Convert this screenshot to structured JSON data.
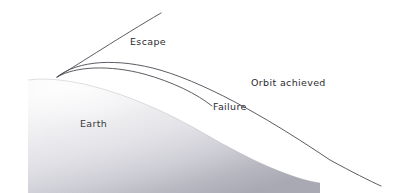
{
  "diagram": {
    "background_color": "#ffffff",
    "width": 399,
    "height": 193,
    "launch_point": {
      "x": 57,
      "y": 77
    },
    "planet": {
      "name": "Earth",
      "label": "Earth",
      "label_position": {
        "x": 80,
        "y": 127
      },
      "fill_light": "#f2f2f4",
      "fill_mid": "#d9d9de",
      "fill_dark": "#b9b9c2",
      "limb_edge_color": "#9a9aa4"
    },
    "trajectories": [
      {
        "id": "escape",
        "label": "Escape",
        "label_position": {
          "x": 130,
          "y": 45
        },
        "stroke_color": "#4a4a52",
        "description": "Near-straight line departing upward to the right, leaving the frame",
        "endpoint": {
          "x": 161,
          "y": 13
        }
      },
      {
        "id": "orbit-achieved",
        "label": "Orbit achieved",
        "label_position": {
          "x": 251,
          "y": 86
        },
        "stroke_color": "#4a4a52",
        "description": "Upper arcing curve that clears the limb and continues off the lower right edge",
        "endpoint": {
          "x": 381,
          "y": 186
        }
      },
      {
        "id": "failure",
        "label": "Failure",
        "label_position": {
          "x": 213,
          "y": 110
        },
        "stroke_color": "#4a4a52",
        "description": "Lower arcing curve that falls back and intersects the planet surface",
        "endpoint": {
          "x": 212,
          "y": 106
        }
      }
    ]
  }
}
